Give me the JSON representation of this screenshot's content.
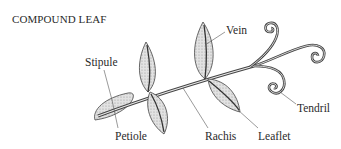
{
  "title": "COMPOUND LEAF",
  "labels": {
    "stipule": "Stipule",
    "vein": "Vein",
    "petiole": "Petiole",
    "rachis": "Rachis",
    "leaflet": "Leaflet",
    "tendril": "Tendril"
  },
  "colors": {
    "leaf_fill": "#cfcfcf",
    "outline": "#3a3a3a",
    "text": "#2a2a2a",
    "background": "#ffffff"
  }
}
